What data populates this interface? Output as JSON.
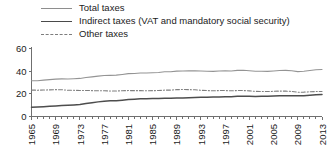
{
  "legend": {
    "position": "top-left",
    "items": [
      {
        "label": "Total taxes",
        "key": "total",
        "color": "#949494",
        "style": "solid"
      },
      {
        "label": "Indirect taxes (VAT and mandatory social security)",
        "key": "indirect",
        "color": "#4d4d4d",
        "style": "solid-thick"
      },
      {
        "label": "Other taxes",
        "key": "other",
        "color": "#7f7f7f",
        "style": "dash-dot"
      }
    ]
  },
  "axes": {
    "y_ticks": [
      "0",
      "20",
      "40",
      "60"
    ],
    "x_ticks": [
      "1965",
      "1969",
      "1973",
      "1977",
      "1981",
      "1985",
      "1989",
      "1993",
      "1997",
      "2001",
      "2005",
      "2009",
      "2013"
    ]
  },
  "chart_data": {
    "type": "line",
    "title": "",
    "subtitle": "",
    "xlabel": "",
    "ylabel": "",
    "xlim": [
      1965,
      2013
    ],
    "ylim": [
      0,
      60
    ],
    "grid": false,
    "legend_position": "top-left",
    "y_tick_values": [
      0,
      20,
      40,
      60
    ],
    "x_tick_values": [
      1965,
      1969,
      1973,
      1977,
      1981,
      1985,
      1989,
      1993,
      1997,
      2001,
      2005,
      2009,
      2013
    ],
    "x": [
      1965,
      1966,
      1967,
      1968,
      1969,
      1970,
      1971,
      1972,
      1973,
      1974,
      1975,
      1976,
      1977,
      1978,
      1979,
      1980,
      1981,
      1982,
      1983,
      1984,
      1985,
      1986,
      1987,
      1988,
      1989,
      1990,
      1991,
      1992,
      1993,
      1994,
      1995,
      1996,
      1997,
      1998,
      1999,
      2000,
      2001,
      2002,
      2003,
      2004,
      2005,
      2006,
      2007,
      2008,
      2009,
      2010,
      2011,
      2012,
      2013
    ],
    "series": [
      {
        "name": "Total taxes",
        "key": "total",
        "color": "#949494",
        "style": "solid",
        "values": [
          31.5,
          31.6,
          32.1,
          32.5,
          33.0,
          33.2,
          33.1,
          33.3,
          33.6,
          34.4,
          35.0,
          35.6,
          36.2,
          36.3,
          36.5,
          37.1,
          37.8,
          38.0,
          38.4,
          38.4,
          38.6,
          38.8,
          39.5,
          39.5,
          40.0,
          40.2,
          40.3,
          40.4,
          40.1,
          39.9,
          39.8,
          40.2,
          40.4,
          40.2,
          40.7,
          40.8,
          40.4,
          39.9,
          39.9,
          39.8,
          40.2,
          40.6,
          40.7,
          40.4,
          39.6,
          39.9,
          40.6,
          41.2,
          41.5
        ]
      },
      {
        "name": "Indirect taxes (VAT and mandatory social security)",
        "key": "indirect",
        "color": "#4d4d4d",
        "style": "solid-thick",
        "values": [
          8.2,
          8.4,
          8.7,
          9.0,
          9.3,
          9.6,
          9.9,
          10.2,
          10.6,
          11.4,
          12.2,
          12.9,
          13.5,
          13.8,
          14.0,
          14.4,
          14.9,
          15.2,
          15.6,
          15.7,
          15.8,
          15.9,
          16.2,
          16.2,
          16.3,
          16.4,
          16.6,
          16.8,
          17.0,
          17.0,
          17.1,
          17.3,
          17.5,
          17.5,
          17.8,
          17.9,
          17.8,
          17.7,
          17.8,
          17.8,
          18.0,
          18.2,
          18.3,
          18.3,
          18.2,
          18.4,
          18.8,
          19.2,
          19.4
        ]
      },
      {
        "name": "Other taxes",
        "key": "other",
        "color": "#7f7f7f",
        "style": "dash-dot",
        "values": [
          23.3,
          23.2,
          23.4,
          23.5,
          23.7,
          23.6,
          23.2,
          23.1,
          23.0,
          23.0,
          22.8,
          22.7,
          22.7,
          22.5,
          22.5,
          22.7,
          22.9,
          22.8,
          22.8,
          22.7,
          22.8,
          22.9,
          23.3,
          23.3,
          23.7,
          23.8,
          23.7,
          23.6,
          23.1,
          22.9,
          22.7,
          22.9,
          22.9,
          22.7,
          22.9,
          22.9,
          22.6,
          22.2,
          22.1,
          22.0,
          22.2,
          22.4,
          22.4,
          22.1,
          21.4,
          21.5,
          21.8,
          22.0,
          22.1
        ]
      }
    ]
  }
}
